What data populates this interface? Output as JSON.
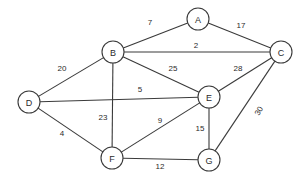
{
  "diagram": {
    "type": "weighted-undirected-graph",
    "title": "",
    "background_color": "#ffffff",
    "stroke_color": "#3a3a3a",
    "text_color": "#2b2b2b",
    "node_radius": 11,
    "nodes": [
      {
        "id": "A",
        "label": "A",
        "x": 198,
        "y": 19
      },
      {
        "id": "B",
        "label": "B",
        "x": 113,
        "y": 52
      },
      {
        "id": "C",
        "label": "C",
        "x": 281,
        "y": 52
      },
      {
        "id": "D",
        "label": "D",
        "x": 29,
        "y": 102
      },
      {
        "id": "E",
        "label": "E",
        "x": 209,
        "y": 97
      },
      {
        "id": "F",
        "label": "F",
        "x": 112,
        "y": 158
      },
      {
        "id": "G",
        "label": "G",
        "x": 209,
        "y": 160
      }
    ],
    "edges": [
      {
        "from": "B",
        "to": "A",
        "weight": "7",
        "lx": 150,
        "ly": 22,
        "rot": 0
      },
      {
        "from": "A",
        "to": "C",
        "weight": "17",
        "lx": 241,
        "ly": 25,
        "rot": 0
      },
      {
        "from": "B",
        "to": "C",
        "weight": "2",
        "lx": 196,
        "ly": 45,
        "rot": 0
      },
      {
        "from": "D",
        "to": "B",
        "weight": "20",
        "lx": 62,
        "ly": 68,
        "rot": 0
      },
      {
        "from": "B",
        "to": "E",
        "weight": "25",
        "lx": 173,
        "ly": 68,
        "rot": 0
      },
      {
        "from": "E",
        "to": "C",
        "weight": "28",
        "lx": 238,
        "ly": 68,
        "rot": 0
      },
      {
        "from": "D",
        "to": "E",
        "weight": "5",
        "lx": 140,
        "ly": 89,
        "rot": 0
      },
      {
        "from": "C",
        "to": "G",
        "weight": "30",
        "lx": 259,
        "ly": 111,
        "rot": -62
      },
      {
        "from": "B",
        "to": "F",
        "weight": "23",
        "lx": 103,
        "ly": 117,
        "rot": 0
      },
      {
        "from": "F",
        "to": "E",
        "weight": "9",
        "lx": 160,
        "ly": 120,
        "rot": 0
      },
      {
        "from": "E",
        "to": "G",
        "weight": "15",
        "lx": 200,
        "ly": 128,
        "rot": 0
      },
      {
        "from": "D",
        "to": "F",
        "weight": "4",
        "lx": 62,
        "ly": 133,
        "rot": 0
      },
      {
        "from": "F",
        "to": "G",
        "weight": "12",
        "lx": 160,
        "ly": 166,
        "rot": 0
      }
    ]
  }
}
